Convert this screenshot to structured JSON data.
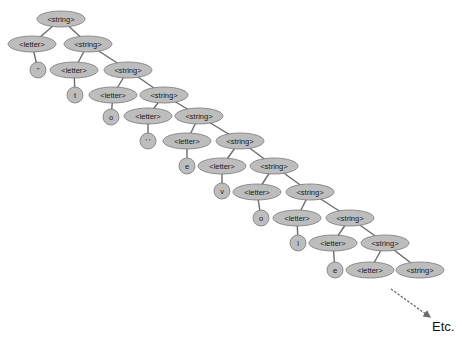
{
  "diagram": {
    "colors": {
      "node_fill": "#bdbdbd",
      "node_stroke": "#7a7a7a",
      "edge": "#6b6b6b",
      "arrow": "#6b6b6b",
      "background": "#ffffff"
    },
    "nodes": [
      {
        "id": "s0",
        "label": "<string>",
        "shape": "ellipse",
        "cx": 61,
        "cy": 19,
        "rx": 24,
        "ry": 8
      },
      {
        "id": "l1",
        "label": "<letter>",
        "shape": "ellipse",
        "cx": 32,
        "cy": 44,
        "rx": 24,
        "ry": 8
      },
      {
        "id": "s1",
        "label": "<string>",
        "shape": "ellipse",
        "cx": 88,
        "cy": 44,
        "rx": 24,
        "ry": 8
      },
      {
        "id": "c1",
        "label": "\"",
        "shape": "circle",
        "cx": 38,
        "cy": 70,
        "r": 8
      },
      {
        "id": "l2",
        "label": "<letter>",
        "shape": "ellipse",
        "cx": 74,
        "cy": 70,
        "rx": 24,
        "ry": 8
      },
      {
        "id": "s2",
        "label": "<string>",
        "shape": "ellipse",
        "cx": 128,
        "cy": 70,
        "rx": 24,
        "ry": 8
      },
      {
        "id": "c2",
        "label": "t",
        "shape": "circle",
        "cx": 75,
        "cy": 95,
        "r": 8
      },
      {
        "id": "l3",
        "label": "<letter>",
        "shape": "ellipse",
        "cx": 113,
        "cy": 95,
        "rx": 24,
        "ry": 8
      },
      {
        "id": "s3",
        "label": "<string>",
        "shape": "ellipse",
        "cx": 164,
        "cy": 95,
        "rx": 24,
        "ry": 8
      },
      {
        "id": "c3",
        "label": "o",
        "shape": "circle",
        "cx": 111,
        "cy": 117,
        "r": 8
      },
      {
        "id": "l4",
        "label": "<letter>",
        "shape": "ellipse",
        "cx": 148,
        "cy": 116,
        "rx": 24,
        "ry": 8
      },
      {
        "id": "s4",
        "label": "<string>",
        "shape": "ellipse",
        "cx": 199,
        "cy": 116,
        "rx": 24,
        "ry": 8
      },
      {
        "id": "c4",
        "label": "' '",
        "shape": "circle",
        "cx": 148,
        "cy": 141,
        "r": 8
      },
      {
        "id": "l5",
        "label": "<letter>",
        "shape": "ellipse",
        "cx": 187,
        "cy": 141,
        "rx": 24,
        "ry": 8
      },
      {
        "id": "s5",
        "label": "<string>",
        "shape": "ellipse",
        "cx": 240,
        "cy": 141,
        "rx": 24,
        "ry": 8
      },
      {
        "id": "c5",
        "label": "e",
        "shape": "circle",
        "cx": 187,
        "cy": 166,
        "r": 8
      },
      {
        "id": "l6",
        "label": "<letter>",
        "shape": "ellipse",
        "cx": 222,
        "cy": 166,
        "rx": 24,
        "ry": 8
      },
      {
        "id": "s6",
        "label": "<string>",
        "shape": "ellipse",
        "cx": 274,
        "cy": 166,
        "rx": 24,
        "ry": 8
      },
      {
        "id": "c6",
        "label": "v",
        "shape": "circle",
        "cx": 222,
        "cy": 191,
        "r": 8
      },
      {
        "id": "l7",
        "label": "<letter>",
        "shape": "ellipse",
        "cx": 257,
        "cy": 192,
        "rx": 24,
        "ry": 8
      },
      {
        "id": "s7",
        "label": "<string>",
        "shape": "ellipse",
        "cx": 310,
        "cy": 192,
        "rx": 24,
        "ry": 8
      },
      {
        "id": "c7",
        "label": "o",
        "shape": "circle",
        "cx": 261,
        "cy": 218,
        "r": 8
      },
      {
        "id": "l8",
        "label": "<letter>",
        "shape": "ellipse",
        "cx": 297,
        "cy": 218,
        "rx": 24,
        "ry": 8
      },
      {
        "id": "s8",
        "label": "<string>",
        "shape": "ellipse",
        "cx": 350,
        "cy": 218,
        "rx": 24,
        "ry": 8
      },
      {
        "id": "c8",
        "label": "l",
        "shape": "circle",
        "cx": 298,
        "cy": 243,
        "r": 8
      },
      {
        "id": "l9",
        "label": "<letter>",
        "shape": "ellipse",
        "cx": 333,
        "cy": 243,
        "rx": 24,
        "ry": 8
      },
      {
        "id": "s9",
        "label": "<string>",
        "shape": "ellipse",
        "cx": 385,
        "cy": 243,
        "rx": 24,
        "ry": 8
      },
      {
        "id": "c9",
        "label": "e",
        "shape": "circle",
        "cx": 335,
        "cy": 270,
        "r": 8
      },
      {
        "id": "l10",
        "label": "<letter>",
        "shape": "ellipse",
        "cx": 370,
        "cy": 270,
        "rx": 24,
        "ry": 8
      },
      {
        "id": "s10",
        "label": "<string>",
        "shape": "ellipse",
        "cx": 420,
        "cy": 270,
        "rx": 24,
        "ry": 8
      }
    ],
    "edges": [
      [
        "s0",
        "l1"
      ],
      [
        "s0",
        "s1"
      ],
      [
        "l1",
        "c1"
      ],
      [
        "s1",
        "l2"
      ],
      [
        "s1",
        "s2"
      ],
      [
        "l2",
        "c2"
      ],
      [
        "s2",
        "l3"
      ],
      [
        "s2",
        "s3"
      ],
      [
        "l3",
        "c3"
      ],
      [
        "s3",
        "l4"
      ],
      [
        "s3",
        "s4"
      ],
      [
        "l4",
        "c4"
      ],
      [
        "s4",
        "l5"
      ],
      [
        "s4",
        "s5"
      ],
      [
        "l5",
        "c5"
      ],
      [
        "s5",
        "l6"
      ],
      [
        "s5",
        "s6"
      ],
      [
        "l6",
        "c6"
      ],
      [
        "s6",
        "l7"
      ],
      [
        "s6",
        "s7"
      ],
      [
        "l7",
        "c7"
      ],
      [
        "s7",
        "l8"
      ],
      [
        "s7",
        "s8"
      ],
      [
        "l8",
        "c8"
      ],
      [
        "s8",
        "l9"
      ],
      [
        "s8",
        "s9"
      ],
      [
        "l9",
        "c9"
      ],
      [
        "s9",
        "l10"
      ],
      [
        "s9",
        "s10"
      ]
    ],
    "continuation": {
      "arrow": {
        "x1": 391,
        "y1": 289,
        "x2": 430,
        "y2": 317,
        "style": "dashed"
      },
      "label": "Etc.",
      "label_x": 432,
      "label_y": 331
    }
  }
}
